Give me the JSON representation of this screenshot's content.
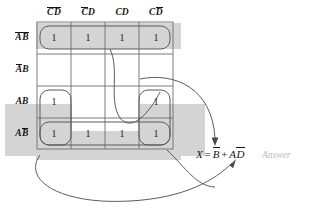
{
  "diagram": {
    "type": "karnaugh-map",
    "title": "",
    "variables": [
      "A",
      "B",
      "C",
      "D"
    ],
    "colors": {
      "shade": "#d4d4d4",
      "grid_line": "#6e6e6e",
      "group_outline": "#5a5a5a",
      "arrow": "#4a4a4a",
      "text": "#141414",
      "answer_text": "#b9b9b9",
      "background": "#ffffff"
    }
  },
  "columns": [
    {
      "id": "col-0",
      "label_parts": [
        {
          "t": "C",
          "bar": true
        },
        {
          "t": "D",
          "bar": true
        }
      ],
      "plain": "C'D'"
    },
    {
      "id": "col-1",
      "label_parts": [
        {
          "t": "C",
          "bar": true
        },
        {
          "t": "D",
          "bar": false
        }
      ],
      "plain": "C'D"
    },
    {
      "id": "col-2",
      "label_parts": [
        {
          "t": "C",
          "bar": false
        },
        {
          "t": "D",
          "bar": false
        }
      ],
      "plain": "CD"
    },
    {
      "id": "col-3",
      "label_parts": [
        {
          "t": "C",
          "bar": false
        },
        {
          "t": "D",
          "bar": true
        }
      ],
      "plain": "CD'"
    }
  ],
  "rows": [
    {
      "id": "row-0",
      "label_parts": [
        {
          "t": "A",
          "bar": true
        },
        {
          "t": "B",
          "bar": true
        }
      ],
      "plain": "A'B'"
    },
    {
      "id": "row-1",
      "label_parts": [
        {
          "t": "A",
          "bar": true
        },
        {
          "t": "B",
          "bar": false
        }
      ],
      "plain": "A'B"
    },
    {
      "id": "row-2",
      "label_parts": [
        {
          "t": "A",
          "bar": false
        },
        {
          "t": "B",
          "bar": false
        }
      ],
      "plain": "AB"
    },
    {
      "id": "row-3",
      "label_parts": [
        {
          "t": "A",
          "bar": false
        },
        {
          "t": "B",
          "bar": true
        }
      ],
      "plain": "AB'"
    }
  ],
  "cells": [
    [
      "1",
      "1",
      "1",
      "1"
    ],
    [
      "",
      "",
      "",
      ""
    ],
    [
      "1",
      "",
      "",
      "1"
    ],
    [
      "1",
      "1",
      "1",
      "1"
    ]
  ],
  "groups": [
    {
      "name": "group-b-not-top-row",
      "term": "B'",
      "rows": [
        0
      ],
      "cols": [
        0,
        1,
        2,
        3
      ]
    },
    {
      "name": "group-b-not-bottom-row",
      "term": "B'",
      "rows": [
        3
      ],
      "cols": [
        0,
        1,
        2,
        3
      ]
    },
    {
      "name": "group-a-d-not-left",
      "term": "AD'",
      "rows": [
        2,
        3
      ],
      "cols": [
        0
      ]
    },
    {
      "name": "group-a-d-not-right",
      "term": "AD'",
      "rows": [
        2,
        3
      ],
      "cols": [
        3
      ]
    }
  ],
  "equation": {
    "lhs": "X",
    "equals": "=",
    "terms": [
      {
        "factors": [
          {
            "t": "B",
            "bar": true
          }
        ]
      },
      {
        "factors": [
          {
            "t": "A",
            "bar": false
          },
          {
            "t": "D",
            "bar": true
          }
        ]
      }
    ],
    "plus": "+",
    "plain": "X = B' + AD'"
  },
  "answer": {
    "label": "Answer"
  },
  "annotations": {
    "arrow_to_equation_from_top": "curve-from-top-row-group",
    "arrow_to_equation_from_right": "curve-from-right-column-group",
    "arrow_to_equation_from_bottom_left": "curve-from-bottom-left-group"
  }
}
